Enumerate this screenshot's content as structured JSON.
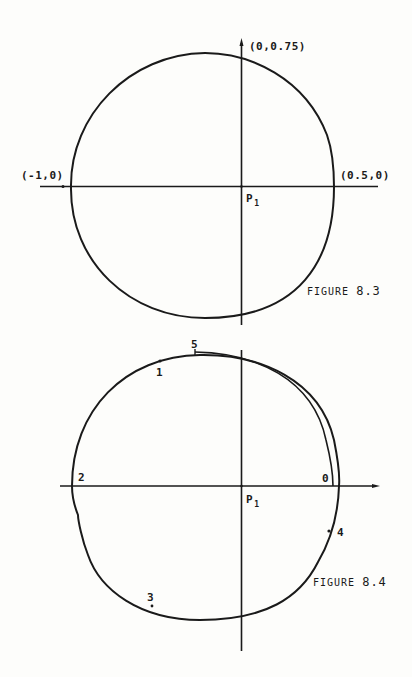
{
  "figures": [
    {
      "id": "figure-8-3",
      "caption": {
        "prefix": "FIGURE",
        "number": "8.3"
      },
      "labels": {
        "top": "(0,0.75)",
        "left": "(-1,0)",
        "right": "(0.5,0)",
        "origin": "P",
        "origin_sub": "1"
      }
    },
    {
      "id": "figure-8-4",
      "caption": {
        "prefix": "FIGURE",
        "number": "8.4"
      },
      "labels": {
        "origin": "P",
        "origin_sub": "1",
        "points": [
          "0",
          "1",
          "2",
          "3",
          "4",
          "5"
        ]
      }
    }
  ],
  "colors": {
    "ink": "#1a1a1a",
    "paper": "#fdfdfb"
  }
}
